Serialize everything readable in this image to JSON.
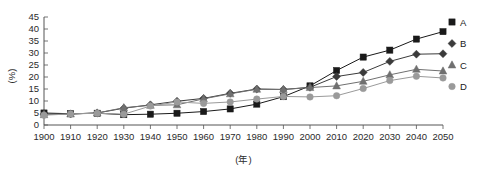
{
  "chart_data": {
    "type": "line",
    "title": "",
    "xlabel": "(年)",
    "ylabel": "(%)",
    "x": [
      1900,
      1910,
      1920,
      1930,
      1940,
      1950,
      1960,
      1970,
      1980,
      1990,
      2000,
      2010,
      2020,
      2030,
      2040,
      2050
    ],
    "categories": [
      "1900",
      "1910",
      "1920",
      "1930",
      "1940",
      "1950",
      "1960",
      "1970",
      "1980",
      "1990",
      "2000",
      "2010",
      "2020",
      "2030",
      "2040",
      "2050"
    ],
    "xlim": [
      1900,
      2050
    ],
    "ylim": [
      0,
      45
    ],
    "yticks": [
      0,
      5,
      10,
      15,
      20,
      25,
      30,
      35,
      40,
      45
    ],
    "ytick_labels": [
      "0",
      "5",
      "10",
      "15",
      "20",
      "25",
      "30",
      "35",
      "40",
      "45"
    ],
    "grid": false,
    "legend_position": "right",
    "series": [
      {
        "name": "A",
        "marker": "square",
        "color": "#1a1a1a",
        "values": [
          5.0,
          4.7,
          4.9,
          4.3,
          4.5,
          4.9,
          5.6,
          6.7,
          8.7,
          11.8,
          16.3,
          22.7,
          28.3,
          31.2,
          35.8,
          38.9
        ]
      },
      {
        "name": "B",
        "marker": "diamond",
        "color": "#3b3b3b",
        "values": [
          4.5,
          4.6,
          5.0,
          7.0,
          8.4,
          9.9,
          11.1,
          13.2,
          15.0,
          14.8,
          15.7,
          20.2,
          21.9,
          26.5,
          29.5,
          29.7
        ]
      },
      {
        "name": "C",
        "marker": "triangle",
        "color": "#707070",
        "values": [
          4.3,
          4.6,
          5.0,
          7.2,
          8.2,
          8.4,
          10.9,
          13.0,
          14.9,
          14.8,
          15.6,
          16.3,
          18.2,
          20.9,
          23.2,
          22.5
        ]
      },
      {
        "name": "D",
        "marker": "circle",
        "color": "#9a9a9a",
        "values": [
          4.1,
          4.6,
          4.9,
          4.5,
          7.9,
          9.6,
          9.0,
          9.6,
          10.8,
          11.9,
          11.7,
          12.2,
          15.2,
          18.5,
          20.3,
          19.6
        ]
      }
    ],
    "legend": [
      {
        "label": "A",
        "marker": "square",
        "color": "#1a1a1a"
      },
      {
        "label": "B",
        "marker": "diamond",
        "color": "#3b3b3b"
      },
      {
        "label": "C",
        "marker": "triangle",
        "color": "#707070"
      },
      {
        "label": "D",
        "marker": "circle",
        "color": "#9a9a9a"
      }
    ]
  }
}
